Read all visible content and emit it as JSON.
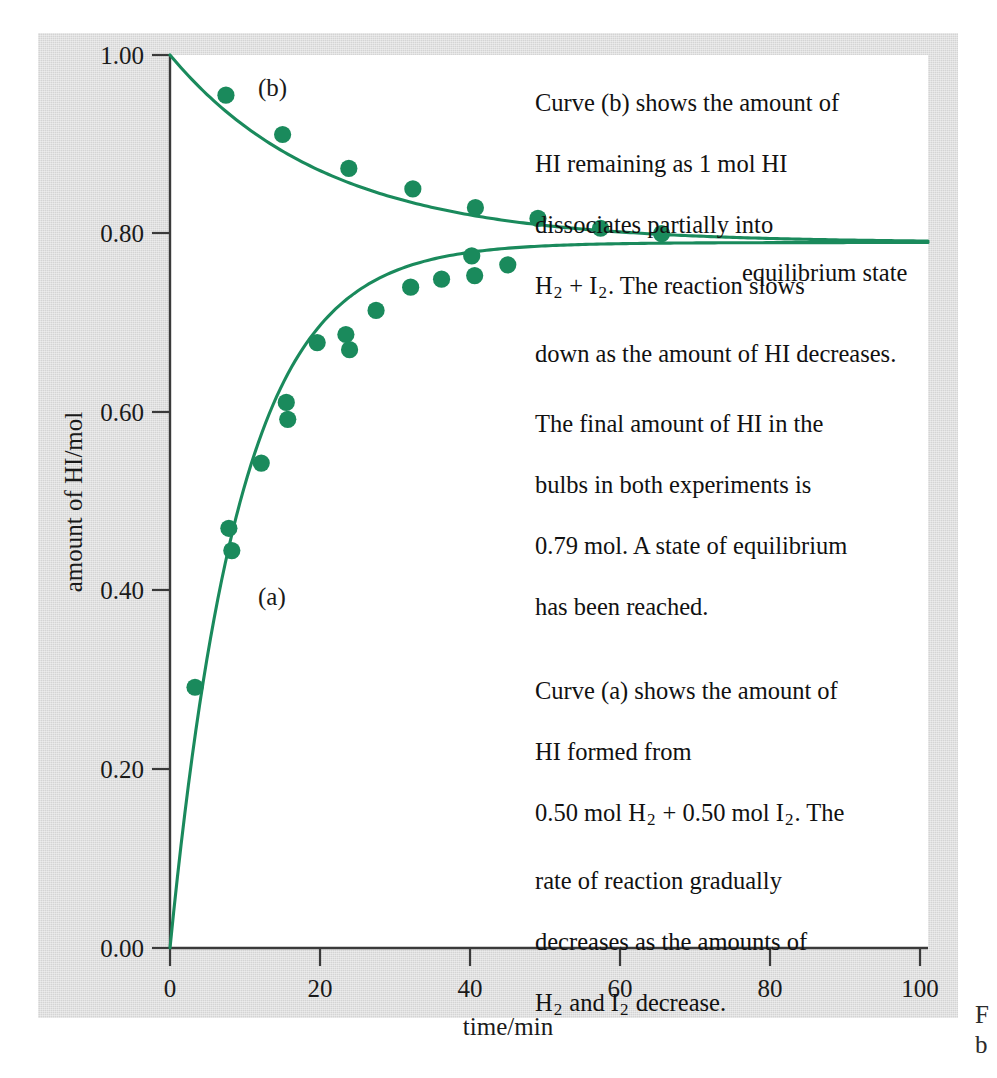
{
  "figure": {
    "background_color": "#d4d4d4",
    "plot_background_color": "#ffffff",
    "accent_color": "#1a8a5c",
    "axis_color": "#3a3a3a"
  },
  "axes": {
    "y_title": "amount of HI/mol",
    "x_title": "time/min",
    "y_ticks": [
      "0.00",
      "0.20",
      "0.40",
      "0.60",
      "0.80",
      "1.00"
    ],
    "x_ticks": [
      "0",
      "20",
      "40",
      "60",
      "80",
      "100"
    ]
  },
  "curve_labels": {
    "a": "(a)",
    "b": "(b)"
  },
  "equilibrium_label": "equilibrium state",
  "annotations": {
    "curve_b_note_line1": "Curve (b) shows the amount of",
    "curve_b_note_line2": "HI remaining as 1 mol HI",
    "curve_b_note_line3": "dissociates partially into",
    "curve_b_note_line4_pre": "H",
    "curve_b_note_line4_sub1": "2",
    "curve_b_note_line4_mid": " + I",
    "curve_b_note_line4_sub2": "2",
    "curve_b_note_line4_post": ".  The reaction slows",
    "curve_b_note_line5": "down as the amount of HI decreases.",
    "middle_note_line1": "The final amount of HI in the",
    "middle_note_line2": "bulbs in both experiments is",
    "middle_note_line3": "0.79 mol.  A state of equilibrium",
    "middle_note_line4": "has been reached.",
    "curve_a_note_line1": "Curve (a) shows the amount of",
    "curve_a_note_line2": "HI formed from",
    "curve_a_note_line3_pre": "0.50 mol H",
    "curve_a_note_line3_sub1": "2",
    "curve_a_note_line3_mid": " + 0.50 mol I",
    "curve_a_note_line3_sub2": "2",
    "curve_a_note_line3_post": ".  The",
    "curve_a_note_line4": "rate of reaction gradually",
    "curve_a_note_line5": "decreases as the amounts of",
    "curve_a_note_line6_pre": "H",
    "curve_a_note_line6_sub1": "2",
    "curve_a_note_line6_mid": " and I",
    "curve_a_note_line6_sub2": "2",
    "curve_a_note_line6_post": " decrease."
  },
  "caption_fragments": {
    "line1": "F",
    "line2": "b"
  },
  "chart_data": {
    "type": "scatter",
    "title": "",
    "xlabel": "time/min",
    "ylabel": "amount of HI/mol",
    "xlim": [
      0,
      103
    ],
    "ylim": [
      0.0,
      1.0
    ],
    "grid": false,
    "legend": "inline curve labels (a) and (b)",
    "equilibrium_value": 0.79,
    "series": [
      {
        "name": "(a) HI formed from 0.50 mol H2 + 0.50 mol I2",
        "color": "#1a8a5c",
        "marker": "filled-circle",
        "points": [
          {
            "x": 3.4,
            "y": 0.292
          },
          {
            "x": 8.0,
            "y": 0.47
          },
          {
            "x": 8.4,
            "y": 0.445
          },
          {
            "x": 12.4,
            "y": 0.543
          },
          {
            "x": 15.8,
            "y": 0.611
          },
          {
            "x": 16.0,
            "y": 0.592
          },
          {
            "x": 20.0,
            "y": 0.678
          },
          {
            "x": 23.9,
            "y": 0.687
          },
          {
            "x": 24.4,
            "y": 0.67
          },
          {
            "x": 28.0,
            "y": 0.714
          },
          {
            "x": 32.7,
            "y": 0.74
          },
          {
            "x": 36.9,
            "y": 0.749
          },
          {
            "x": 41.0,
            "y": 0.775
          },
          {
            "x": 41.4,
            "y": 0.753
          },
          {
            "x": 45.9,
            "y": 0.765
          }
        ],
        "fit_curve": {
          "model": "approach-to-equilibrium",
          "y0": 0.0,
          "y_inf": 0.79,
          "rate_const": 0.105
        }
      },
      {
        "name": "(b) HI remaining as 1 mol HI dissociates",
        "color": "#1a8a5c",
        "marker": "filled-circle",
        "points": [
          {
            "x": 7.6,
            "y": 0.955
          },
          {
            "x": 15.3,
            "y": 0.911
          },
          {
            "x": 24.3,
            "y": 0.873
          },
          {
            "x": 33.0,
            "y": 0.85
          },
          {
            "x": 41.5,
            "y": 0.829
          },
          {
            "x": 50.0,
            "y": 0.817
          },
          {
            "x": 58.5,
            "y": 0.806
          },
          {
            "x": 66.8,
            "y": 0.8
          }
        ],
        "fit_curve": {
          "model": "approach-to-equilibrium",
          "y0": 1.0,
          "y_inf": 0.79,
          "rate_const": 0.047
        }
      }
    ]
  }
}
